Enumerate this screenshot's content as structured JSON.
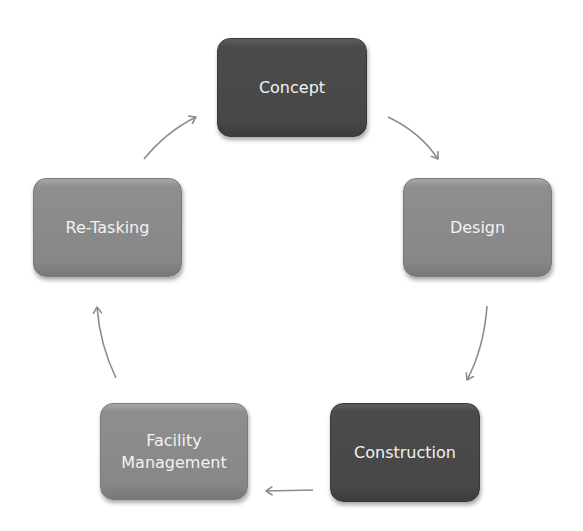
{
  "diagram": {
    "type": "cycle",
    "colors": {
      "dark": "#4a4a4a",
      "medium": "#8a8a8a",
      "text": "#f2f2f2",
      "arrow": "#8c8c8c",
      "background": "#ffffff"
    },
    "nodes": [
      {
        "id": "concept",
        "label": "Concept",
        "tone": "dark"
      },
      {
        "id": "design",
        "label": "Design",
        "tone": "medium"
      },
      {
        "id": "construction",
        "label": "Construction",
        "tone": "dark"
      },
      {
        "id": "facility-management",
        "label": "Facility\nManagement",
        "line1": "Facility",
        "line2": "Management",
        "tone": "medium"
      },
      {
        "id": "re-tasking",
        "label": "Re-Tasking",
        "tone": "medium"
      }
    ],
    "edges": [
      {
        "from": "concept",
        "to": "design"
      },
      {
        "from": "design",
        "to": "construction"
      },
      {
        "from": "construction",
        "to": "facility-management"
      },
      {
        "from": "facility-management",
        "to": "re-tasking"
      },
      {
        "from": "re-tasking",
        "to": "concept"
      }
    ]
  }
}
